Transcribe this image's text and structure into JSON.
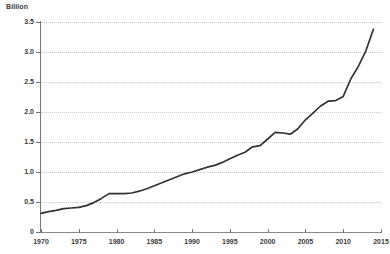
{
  "chart_data": {
    "type": "line",
    "title": "",
    "subtitle": "",
    "xlabel": "",
    "ylabel": "Billion",
    "ylim": [
      0,
      3.5
    ],
    "xlim": [
      1970,
      2015
    ],
    "grid": true,
    "legend": "none",
    "y_ticks": [
      "0",
      "0.5",
      "1.0",
      "1.5",
      "2.0",
      "2.5",
      "3.0",
      "3.5"
    ],
    "y_tick_values": [
      0,
      0.5,
      1.0,
      1.5,
      2.0,
      2.5,
      3.0,
      3.5
    ],
    "x_ticks": [
      "1970",
      "1975",
      "1980",
      "1985",
      "1990",
      "1995",
      "2000",
      "2005",
      "2010",
      "2015"
    ],
    "x_tick_values": [
      1970,
      1975,
      1980,
      1985,
      1990,
      1995,
      2000,
      2005,
      2010,
      2015
    ],
    "series": [
      {
        "name": "Billion",
        "color": "#333333",
        "x": [
          1970,
          1971,
          1972,
          1973,
          1974,
          1975,
          1976,
          1977,
          1978,
          1979,
          1980,
          1981,
          1982,
          1983,
          1984,
          1985,
          1986,
          1987,
          1988,
          1989,
          1990,
          1991,
          1992,
          1993,
          1994,
          1995,
          1996,
          1997,
          1998,
          1999,
          2000,
          2001,
          2002,
          2003,
          2004,
          2005,
          2006,
          2007,
          2008,
          2009,
          2010,
          2011,
          2012,
          2013,
          2014
        ],
        "values": [
          0.31,
          0.34,
          0.36,
          0.39,
          0.4,
          0.41,
          0.44,
          0.49,
          0.56,
          0.64,
          0.64,
          0.64,
          0.65,
          0.68,
          0.72,
          0.77,
          0.82,
          0.87,
          0.92,
          0.97,
          1.0,
          1.04,
          1.08,
          1.11,
          1.16,
          1.22,
          1.28,
          1.33,
          1.42,
          1.44,
          1.55,
          1.66,
          1.65,
          1.63,
          1.72,
          1.87,
          1.98,
          2.1,
          2.18,
          2.19,
          2.26,
          2.55,
          2.76,
          3.02,
          3.38
        ]
      }
    ]
  }
}
